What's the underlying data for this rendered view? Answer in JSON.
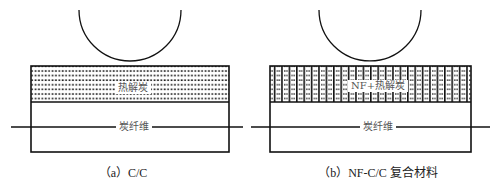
{
  "panels": [
    {
      "id": "a",
      "caption": "（a）C/C",
      "top_layer_label": "热解炭",
      "bottom_layer_label": "炭纤维",
      "top_layer_pattern": "dots"
    },
    {
      "id": "b",
      "caption": "（b）NF-C/C 复合材料",
      "top_layer_label": "NF+热解炭",
      "bottom_layer_label": "炭纤维",
      "top_layer_pattern": "vertical-lines-with-dots"
    }
  ],
  "colors": {
    "line": "#111111",
    "background": "#ffffff",
    "label": "#555555"
  }
}
